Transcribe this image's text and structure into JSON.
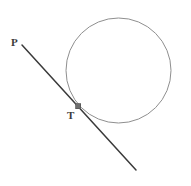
{
  "figure": {
    "background_color": "#ffffff",
    "width": 191,
    "height": 186
  },
  "chart_data": {
    "type": "diagram",
    "subtype": "geometry-tangent-circle",
    "title": "",
    "xlabel": "",
    "ylabel": "",
    "grid": false,
    "legend": null,
    "axis_visible": false,
    "coordinate_space": {
      "x": [
        0,
        191
      ],
      "y": [
        0,
        186
      ],
      "y_axis_down": true
    },
    "shapes": [
      {
        "name": "circle",
        "type": "circle",
        "cx": 118.5,
        "cy": 70.5,
        "r": 52.5,
        "stroke": "#8f8f8f",
        "stroke_width": 1,
        "fill": "none"
      },
      {
        "name": "tangent-line",
        "type": "line",
        "x1": 22,
        "y1": 45,
        "x2": 136,
        "y2": 170,
        "stroke": "#3a3a3a",
        "stroke_width": 1.5,
        "fill": "none"
      },
      {
        "name": "tangent-point-marker",
        "type": "square",
        "cx": 78,
        "cy": 106,
        "size": 5,
        "stroke": "#555555",
        "fill": "#6e6e6e"
      }
    ],
    "points": [
      {
        "id": "P",
        "label": "P",
        "x": 22,
        "y": 45,
        "label_x": 11,
        "label_y": 37,
        "role": "external-point-on-line"
      },
      {
        "id": "T",
        "label": "T",
        "x": 78,
        "y": 106,
        "label_x": 67,
        "label_y": 110,
        "role": "point-of-tangency"
      }
    ],
    "annotations": []
  },
  "labels": {
    "p_label": "P",
    "t_label": "T"
  },
  "colors": {
    "circle_stroke": "#8f8f8f",
    "line_stroke": "#3a3a3a",
    "marker_fill": "#6e6e6e",
    "marker_stroke": "#555555",
    "label_text": "#3c3c3c",
    "background": "#ffffff"
  }
}
